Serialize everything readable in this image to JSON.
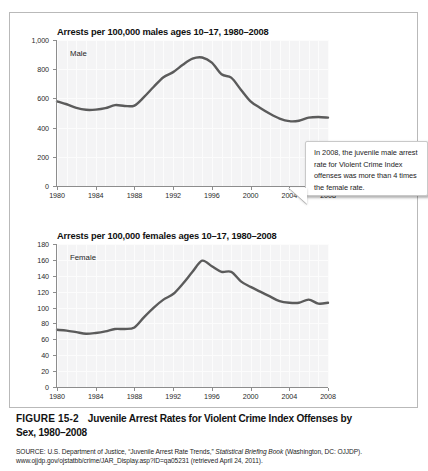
{
  "figure": {
    "number_label": "FIGURE 15-2",
    "caption_main": "Juvenile Arrest Rates for Violent Crime Index Offenses by",
    "caption_second_line": "Sex, 1980–2008",
    "source_prefix": "SOURCE: U.S. Department of Justice, “Juvenile Arrest Rate Trends,” ",
    "source_italic": "Statistical Briefing Book",
    "source_suffix": " (Washington, DC: OJJDP). www.ojjdp.gov/ojstatbb/crime/JAR_Display.asp?ID=qa05231 (retrieved April 24, 2011)."
  },
  "callout": {
    "text": "In 2008, the juvenile male arrest rate for Violent Crime Index offenses was more than 4 times the female rate."
  },
  "chart_data": [
    {
      "type": "line",
      "title": "Arrests per 100,000 males ages 10–17, 1980–2008",
      "series_label": "Male",
      "xlabel": "",
      "ylabel": "",
      "xlim": [
        1980,
        2008
      ],
      "ylim": [
        0,
        1000
      ],
      "grid": true,
      "legend_position": "inside-top-left",
      "ytick_labels": [
        "1,000",
        "800",
        "600",
        "400",
        "200",
        "0"
      ],
      "yticks": [
        1000,
        800,
        600,
        400,
        200,
        0
      ],
      "xtick_labels": [
        "1980",
        "1984",
        "1988",
        "1992",
        "1996",
        "2000",
        "2004",
        "2008"
      ],
      "xticks": [
        1980,
        1984,
        1988,
        1992,
        1996,
        2000,
        2004,
        2008
      ],
      "x": [
        1980,
        1981,
        1982,
        1983,
        1984,
        1985,
        1986,
        1987,
        1988,
        1989,
        1990,
        1991,
        1992,
        1993,
        1994,
        1995,
        1996,
        1997,
        1998,
        1999,
        2000,
        2001,
        2002,
        2003,
        2004,
        2005,
        2006,
        2007,
        2008
      ],
      "values": [
        580,
        560,
        535,
        522,
        523,
        533,
        554,
        548,
        551,
        610,
        680,
        745,
        780,
        830,
        872,
        880,
        845,
        765,
        742,
        660,
        580,
        535,
        495,
        462,
        444,
        447,
        468,
        473,
        468
      ]
    },
    {
      "type": "line",
      "title": "Arrests per 100,000 females ages 10–17, 1980–2008",
      "series_label": "Female",
      "xlabel": "",
      "ylabel": "",
      "xlim": [
        1980,
        2008
      ],
      "ylim": [
        0,
        180
      ],
      "grid": true,
      "legend_position": "inside-top-left",
      "ytick_labels": [
        "180",
        "160",
        "140",
        "120",
        "100",
        "80",
        "60",
        "40",
        "20",
        "0"
      ],
      "yticks": [
        180,
        160,
        140,
        120,
        100,
        80,
        60,
        40,
        20,
        0
      ],
      "xtick_labels": [
        "1980",
        "1984",
        "1988",
        "1992",
        "1996",
        "2000",
        "2004",
        "2008"
      ],
      "xticks": [
        1980,
        1984,
        1988,
        1992,
        1996,
        2000,
        2004,
        2008
      ],
      "x": [
        1980,
        1981,
        1982,
        1983,
        1984,
        1985,
        1986,
        1987,
        1988,
        1989,
        1990,
        1991,
        1992,
        1993,
        1994,
        1995,
        1996,
        1997,
        1998,
        1999,
        2000,
        2001,
        2002,
        2003,
        2004,
        2005,
        2006,
        2007,
        2008
      ],
      "values": [
        72,
        71,
        69,
        67,
        68,
        70,
        73,
        73,
        75,
        88,
        100,
        110,
        117,
        130,
        145,
        159,
        152,
        145,
        145,
        133,
        126,
        120,
        114,
        108,
        106,
        106,
        110,
        105,
        106
      ]
    }
  ],
  "colors": {
    "line": "#5b5b5b",
    "plot_background": "#f4f4f5",
    "axis": "#8d8d8d",
    "frame_border": "#b9b9b9",
    "callout_border": "#c9c9c9"
  }
}
